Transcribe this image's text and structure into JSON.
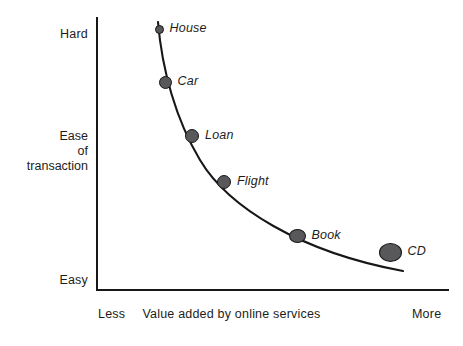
{
  "chart_data": {
    "type": "scatter",
    "title": "",
    "subtitle": "",
    "xlabel": "Value added by online services",
    "ylabel": "Ease of transaction",
    "x_axis": {
      "label": "Value added by online services",
      "min_tick": "Less",
      "max_tick": "More",
      "grid": false
    },
    "y_axis": {
      "label_lines": [
        "Ease",
        "of",
        "transaction"
      ],
      "max_tick": "Hard",
      "min_tick": "Easy",
      "grid": false
    },
    "legend": {
      "visible": false,
      "position": "none"
    },
    "annotations": [
      "Curve shows inverse relationship: transactions that are hard have less value added by online services."
    ],
    "series": [
      {
        "name": "Transaction types",
        "points": [
          {
            "label": "House",
            "x_norm": 0.18,
            "y_norm": 0.96,
            "x_px": 159,
            "y_px": 29,
            "marker_w": 9,
            "marker_h": 9
          },
          {
            "label": "Car",
            "x_norm": 0.2,
            "y_norm": 0.76,
            "x_px": 165,
            "y_px": 82,
            "marker_w": 13,
            "marker_h": 13
          },
          {
            "label": "Loan",
            "x_norm": 0.28,
            "y_norm": 0.56,
            "x_px": 192,
            "y_px": 136,
            "marker_w": 14,
            "marker_h": 14
          },
          {
            "label": "Flight",
            "x_norm": 0.37,
            "y_norm": 0.39,
            "x_px": 224,
            "y_px": 182,
            "marker_w": 14,
            "marker_h": 14
          },
          {
            "label": "Book",
            "x_norm": 0.58,
            "y_norm": 0.2,
            "x_px": 297,
            "y_px": 236,
            "marker_w": 17,
            "marker_h": 14
          },
          {
            "label": "CD",
            "x_norm": 0.84,
            "y_norm": 0.14,
            "x_px": 390,
            "y_px": 252,
            "marker_w": 23,
            "marker_h": 19
          }
        ]
      }
    ],
    "curve": {
      "description": "smooth decaying curve from upper-left to lower-right",
      "path": "M 158 22 C 162 70, 176 120, 200 160 C 228 207, 300 252, 403 271"
    },
    "colors": {
      "marker_fill": "#58585a",
      "marker_stroke": "#17171a",
      "axis": "#17171a",
      "curve": "#17171a",
      "text": "#1d1d20",
      "background": "#ffffff"
    }
  }
}
